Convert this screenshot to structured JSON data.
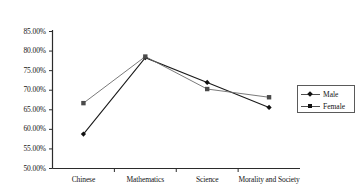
{
  "chart_data": {
    "type": "line",
    "title": "",
    "subtitle": "",
    "xlabel": "",
    "ylabel": "",
    "categories": [
      "Chinese",
      "Mathematics",
      "Science",
      "Morality and Society"
    ],
    "series": [
      {
        "name": "Male",
        "values": [
          58.8,
          78.3,
          72.0,
          65.6
        ],
        "marker": "diamond",
        "color": "#1a1a1a"
      },
      {
        "name": "Female",
        "values": [
          66.7,
          78.6,
          70.3,
          68.2
        ],
        "marker": "square",
        "color": "#6b6b6b"
      }
    ],
    "ylim": [
      50.0,
      85.0
    ],
    "ytick_values": [
      50.0,
      55.0,
      60.0,
      65.0,
      70.0,
      75.0,
      80.0,
      85.0
    ],
    "ytick_labels": [
      "50.00%",
      "55.00%",
      "60.00%",
      "65.00%",
      "70.00%",
      "75.00%",
      "80.00%",
      "85.00%"
    ],
    "grid": false,
    "legend_position": "right",
    "legend_entries": [
      "Male",
      "Female"
    ]
  },
  "axes": {
    "y_axis_name": "y-axis",
    "x_axis_name": "x-axis"
  }
}
